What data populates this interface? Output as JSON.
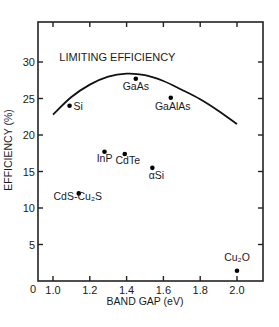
{
  "chart_data": {
    "type": "scatter",
    "title": "",
    "xlabel": "BAND GAP (eV)",
    "ylabel": "EFFICIENCY (%)",
    "xlim": [
      0.9,
      2.15
    ],
    "ylim": [
      0,
      35
    ],
    "x_ticks": [
      1.0,
      1.2,
      1.4,
      1.6,
      1.8,
      2.0
    ],
    "x_tick_labels": [
      "1.0",
      "1.2",
      "1.4",
      "1.6",
      "1.8",
      "2.0"
    ],
    "y_ticks": [
      5,
      10,
      15,
      20,
      25,
      30
    ],
    "y_tick_labels": [
      "5",
      "10",
      "15",
      "20",
      "25",
      "30"
    ],
    "origin_label": "0",
    "grid": false,
    "legend": null,
    "series": [
      {
        "name": "Solar cell materials",
        "type": "scatter",
        "points": [
          {
            "label": "Si",
            "x": 1.09,
            "y": 24.0
          },
          {
            "label": "GaAs",
            "x": 1.45,
            "y": 27.7
          },
          {
            "label": "GaAlAs",
            "x": 1.64,
            "y": 25.1
          },
          {
            "label": "InP",
            "x": 1.28,
            "y": 17.7
          },
          {
            "label": "CdTe",
            "x": 1.39,
            "y": 17.4
          },
          {
            "label": "αSi",
            "x": 1.54,
            "y": 15.5
          },
          {
            "label": "CdS-Cu₂S",
            "x": 1.14,
            "y": 12.0
          },
          {
            "label": "Cu₂O",
            "x": 2.0,
            "y": 1.4
          }
        ]
      },
      {
        "name": "LIMITING EFFICIENCY",
        "type": "line",
        "x": [
          1.0,
          1.1,
          1.2,
          1.3,
          1.4,
          1.5,
          1.6,
          1.7,
          1.8,
          1.9,
          2.0
        ],
        "y": [
          22.8,
          25.2,
          26.9,
          28.0,
          28.4,
          28.2,
          27.4,
          26.2,
          24.9,
          23.3,
          21.5
        ]
      }
    ],
    "annotations": [
      {
        "text": "LIMITING EFFICIENCY",
        "x": 1.35,
        "y": 30.2
      }
    ]
  }
}
